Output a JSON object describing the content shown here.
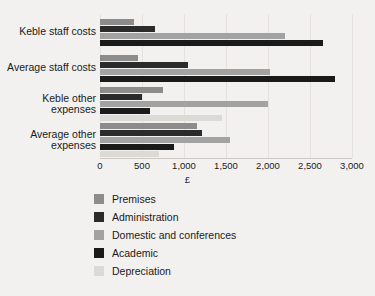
{
  "chart_data": {
    "type": "bar",
    "orientation": "horizontal",
    "title": "",
    "xlabel": "£",
    "ylabel": "",
    "xlim": [
      0,
      3000
    ],
    "grid": true,
    "legend_position": "bottom",
    "xticks": [
      "0",
      "500",
      "1,000",
      "1,500",
      "2,000",
      "2,500",
      "3,000"
    ],
    "xtick_values": [
      0,
      500,
      1000,
      1500,
      2000,
      2500,
      3000
    ],
    "categories": [
      "Keble staff costs",
      "Average staff costs",
      "Keble other expenses",
      "Average other expenses"
    ],
    "series": [
      {
        "name": "Premises",
        "color": "#8c8c8c",
        "values": [
          400,
          450,
          750,
          1160
        ]
      },
      {
        "name": "Administration",
        "color": "#2b2b2b",
        "values": [
          650,
          1050,
          500,
          1220
        ]
      },
      {
        "name": "Domestic and conferences",
        "color": "#a2a2a2",
        "values": [
          2200,
          2020,
          2000,
          1550
        ]
      },
      {
        "name": "Academic",
        "color": "#1a1a1a",
        "values": [
          2650,
          2800,
          600,
          880
        ]
      },
      {
        "name": "Depreciation",
        "color": "#dcdad7",
        "values": [
          null,
          null,
          1450,
          700
        ]
      }
    ]
  },
  "legend": {
    "items": [
      {
        "label": "Premises",
        "color": "#8c8c8c"
      },
      {
        "label": "Administration",
        "color": "#2b2b2b"
      },
      {
        "label": "Domestic and conferences",
        "color": "#a2a2a2"
      },
      {
        "label": "Academic",
        "color": "#1a1a1a"
      },
      {
        "label": "Depreciation",
        "color": "#dcdad7"
      }
    ]
  },
  "axis": {
    "x_title": "£"
  }
}
